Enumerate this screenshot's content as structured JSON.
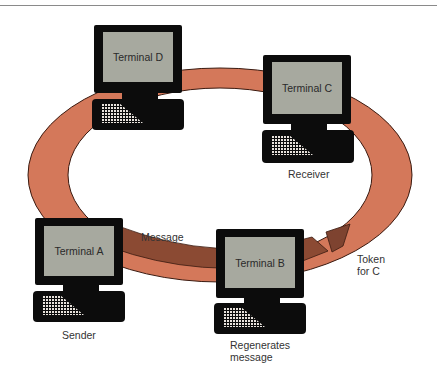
{
  "diagram": {
    "type": "token-ring network",
    "colors": {
      "ring": "#d4785a",
      "ring_outline": "#3a1a10",
      "message_segment": "#8b4a33",
      "token": "#7e4330",
      "terminal_body": "#0c0c0c",
      "terminal_screen": "#a7a99f"
    },
    "terminals": [
      {
        "id": "D",
        "screen_label": "Terminal D",
        "role_label": ""
      },
      {
        "id": "C",
        "screen_label": "Terminal C",
        "role_label": "Receiver"
      },
      {
        "id": "A",
        "screen_label": "Terminal A",
        "role_label": "Sender"
      },
      {
        "id": "B",
        "screen_label": "Terminal B",
        "role_label": "Regenerates",
        "role_label_2": "message"
      }
    ],
    "annotations": {
      "message": "Message",
      "token_line1": "Token",
      "token_line2": "for C"
    }
  }
}
